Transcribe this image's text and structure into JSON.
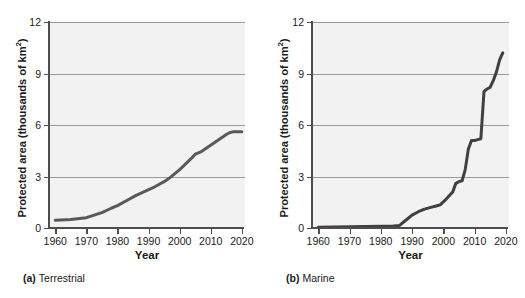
{
  "figure": {
    "panels": [
      {
        "id": "terrestrial",
        "caption_marker": "(a)",
        "caption_text": "Terrestrial",
        "ylabel_main": "Protected area (thousands of km",
        "ylabel_sup": "2",
        "ylabel_close": ")",
        "xlabel": "Year"
      },
      {
        "id": "marine",
        "caption_marker": "(b)",
        "caption_text": "Marine",
        "ylabel_main": "Protected area (thousands of km",
        "ylabel_sup": "2",
        "ylabel_close": ")",
        "xlabel": "Year"
      }
    ]
  },
  "chart_data": [
    {
      "type": "line",
      "id": "terrestrial",
      "title": "(a) Terrestrial",
      "xlabel": "Year",
      "ylabel": "Protected area (thousands of km²)",
      "xlim": [
        1958,
        2021
      ],
      "ylim": [
        0,
        12
      ],
      "xticks": [
        1960,
        1970,
        1980,
        1990,
        2000,
        2010,
        2020
      ],
      "yticks": [
        0,
        3,
        6,
        9,
        12
      ],
      "grid": "horizontal",
      "legend": "none",
      "line_color": "#595959",
      "plot_background": "#f2f2f2",
      "x": [
        1960,
        1965,
        1970,
        1972,
        1975,
        1978,
        1980,
        1983,
        1986,
        1989,
        1992,
        1995,
        1997,
        2000,
        2002,
        2004,
        2005,
        2007,
        2009,
        2011,
        2013,
        2015,
        2016,
        2017,
        2018,
        2020
      ],
      "y": [
        0.45,
        0.5,
        0.6,
        0.72,
        0.9,
        1.15,
        1.3,
        1.6,
        1.9,
        2.15,
        2.4,
        2.7,
        2.95,
        3.4,
        3.75,
        4.1,
        4.3,
        4.45,
        4.7,
        4.95,
        5.2,
        5.45,
        5.55,
        5.6,
        5.6,
        5.6
      ]
    },
    {
      "type": "line",
      "id": "marine",
      "title": "(b) Marine",
      "xlabel": "Year",
      "ylabel": "Protected area (thousands of km²)",
      "xlim": [
        1958,
        2021
      ],
      "ylim": [
        0,
        12
      ],
      "xticks": [
        1960,
        1970,
        1980,
        1990,
        2000,
        2010,
        2020
      ],
      "yticks": [
        0,
        3,
        6,
        9,
        12
      ],
      "grid": "horizontal",
      "legend": "none",
      "line_color": "#404040",
      "plot_background": "#f2f2f2",
      "x": [
        1960,
        1970,
        1980,
        1984,
        1986,
        1988,
        1990,
        1992,
        1994,
        1996,
        1998,
        1999,
        2001,
        2003,
        2004,
        2005,
        2006,
        2007,
        2008,
        2009,
        2010,
        2011,
        2012,
        2013,
        2014,
        2015,
        2016,
        2017,
        2018,
        2019
      ],
      "y": [
        0.05,
        0.07,
        0.1,
        0.12,
        0.15,
        0.45,
        0.75,
        0.95,
        1.1,
        1.2,
        1.3,
        1.35,
        1.7,
        2.1,
        2.6,
        2.7,
        2.75,
        3.4,
        4.6,
        5.1,
        5.1,
        5.15,
        5.2,
        7.95,
        8.1,
        8.2,
        8.6,
        9.1,
        9.8,
        10.2
      ]
    }
  ]
}
